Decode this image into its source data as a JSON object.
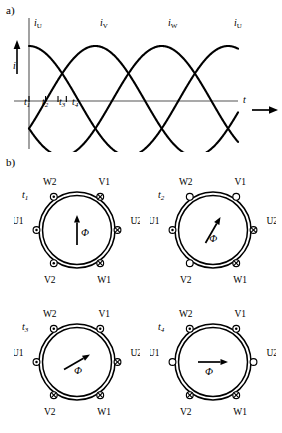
{
  "figure": {
    "part_a_label": "a)",
    "part_b_label": "b)"
  },
  "chart_data": {
    "type": "line",
    "title": "",
    "xlabel": "t",
    "ylabel": "i",
    "grid": false,
    "legend_position": "inline-above-curves",
    "xlim": [
      0,
      4.2
    ],
    "ylim": [
      -1.15,
      1.15
    ],
    "x_axis_label": "t",
    "y_axis_label": "i",
    "tick_labels": [
      "t1",
      "t2",
      "t3",
      "t4"
    ],
    "tick_values": [
      0.0,
      0.333,
      0.583,
      0.75
    ],
    "series": [
      {
        "name": "iU",
        "label": "i_U",
        "phase_deg": 90,
        "amplitude": 1
      },
      {
        "name": "iV",
        "label": "i_V",
        "phase_deg": -30,
        "amplitude": 1
      },
      {
        "name": "iW",
        "label": "i_W",
        "phase_deg": 210,
        "amplitude": 1
      }
    ],
    "curve_labels": [
      {
        "text": "i",
        "sub": "U"
      },
      {
        "text": "i",
        "sub": "V"
      },
      {
        "text": "i",
        "sub": "W"
      },
      {
        "text": "i",
        "sub": "U"
      }
    ]
  },
  "stator_diagrams": [
    {
      "time_label": "t",
      "time_sub": "1",
      "flux_label": "Φ",
      "flux_angle_deg": 90,
      "flux_arrow_length": 30,
      "terminals": [
        {
          "name": "W2",
          "position": "upper-left",
          "state": "dot"
        },
        {
          "name": "V1",
          "position": "upper-right",
          "state": "cross"
        },
        {
          "name": "U1",
          "position": "left",
          "state": "dot"
        },
        {
          "name": "U2",
          "position": "right",
          "state": "cross"
        },
        {
          "name": "V2",
          "position": "lower-left",
          "state": "dot"
        },
        {
          "name": "W1",
          "position": "lower-right",
          "state": "cross"
        }
      ]
    },
    {
      "time_label": "t",
      "time_sub": "2",
      "flux_label": "Φ",
      "flux_angle_deg": 60,
      "flux_arrow_length": 30,
      "terminals": [
        {
          "name": "W2",
          "position": "upper-left",
          "state": "empty"
        },
        {
          "name": "V1",
          "position": "upper-right",
          "state": "empty"
        },
        {
          "name": "U1",
          "position": "left",
          "state": "dot"
        },
        {
          "name": "U2",
          "position": "right",
          "state": "cross"
        },
        {
          "name": "V2",
          "position": "lower-left",
          "state": "empty"
        },
        {
          "name": "W1",
          "position": "lower-right",
          "state": "cross"
        }
      ]
    },
    {
      "time_label": "t",
      "time_sub": "3",
      "flux_label": "Φ",
      "flux_angle_deg": 30,
      "flux_arrow_length": 30,
      "terminals": [
        {
          "name": "W2",
          "position": "upper-left",
          "state": "dot"
        },
        {
          "name": "V1",
          "position": "upper-right",
          "state": "dot"
        },
        {
          "name": "U1",
          "position": "left",
          "state": "dot"
        },
        {
          "name": "U2",
          "position": "right",
          "state": "cross"
        },
        {
          "name": "V2",
          "position": "lower-left",
          "state": "cross"
        },
        {
          "name": "W1",
          "position": "lower-right",
          "state": "cross"
        }
      ]
    },
    {
      "time_label": "t",
      "time_sub": "4",
      "flux_label": "Φ",
      "flux_angle_deg": 0,
      "flux_arrow_length": 30,
      "terminals": [
        {
          "name": "W2",
          "position": "upper-left",
          "state": "dot"
        },
        {
          "name": "V1",
          "position": "upper-right",
          "state": "dot"
        },
        {
          "name": "U1",
          "position": "left",
          "state": "empty"
        },
        {
          "name": "U2",
          "position": "right",
          "state": "empty"
        },
        {
          "name": "V2",
          "position": "lower-left",
          "state": "cross"
        },
        {
          "name": "W1",
          "position": "lower-right",
          "state": "cross"
        }
      ]
    }
  ],
  "colors": {
    "line": "#000000",
    "axis": "#555555",
    "background": "#ffffff"
  }
}
